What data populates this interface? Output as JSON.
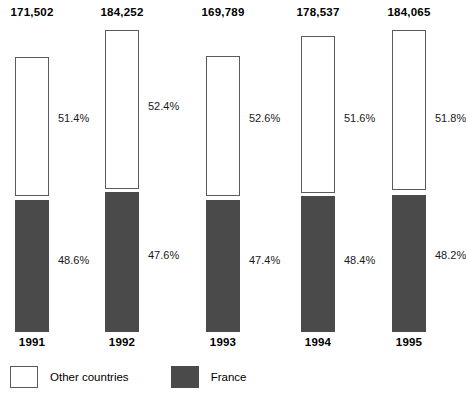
{
  "chart_data": {
    "type": "bar",
    "title": "",
    "subtitle": "",
    "xlabel": "",
    "ylabel": "",
    "stacked": true,
    "stacked_normalized": true,
    "orientation": "vertical",
    "grid": false,
    "axis_lines": false,
    "legend_position": "bottom-left",
    "categories": [
      "1991",
      "1992",
      "1993",
      "1994",
      "1995"
    ],
    "totals": [
      171502,
      184252,
      169789,
      178537,
      184065
    ],
    "total_labels": [
      "171,502",
      "184,252",
      "169,789",
      "178,537",
      "184,065"
    ],
    "series": [
      {
        "name": "Other countries",
        "color": "#ffffff",
        "border_color": "#5a5a5a",
        "values": [
          51.4,
          52.4,
          52.6,
          51.6,
          51.8
        ],
        "value_labels": [
          "51.4%",
          "52.4%",
          "52.6%",
          "51.6%",
          "51.8%"
        ]
      },
      {
        "name": "France",
        "color": "#4a4a4a",
        "border_color": "#4a4a4a",
        "values": [
          48.6,
          47.6,
          47.4,
          48.4,
          48.2
        ],
        "value_labels": [
          "48.6%",
          "47.6%",
          "47.4%",
          "48.4%",
          "48.2%"
        ]
      }
    ]
  },
  "columns": [
    {
      "year": "1991",
      "total_label": "171,502",
      "left": 15,
      "width": 34,
      "other": {
        "label": "51.4%",
        "top": 57,
        "height": 139,
        "label_top": 112
      },
      "france": {
        "label": "48.6%",
        "top": 200,
        "height": 132,
        "label_top": 254
      }
    },
    {
      "year": "1992",
      "total_label": "184,252",
      "left": 105,
      "width": 34,
      "other": {
        "label": "52.4%",
        "top": 30,
        "height": 159,
        "label_top": 100
      },
      "france": {
        "label": "47.6%",
        "top": 192,
        "height": 140,
        "label_top": 249
      }
    },
    {
      "year": "1993",
      "total_label": "169,789",
      "left": 206,
      "width": 34,
      "other": {
        "label": "52.6%",
        "top": 56,
        "height": 140,
        "label_top": 112
      },
      "france": {
        "label": "47.4%",
        "top": 200,
        "height": 132,
        "label_top": 254
      }
    },
    {
      "year": "1994",
      "total_label": "178,537",
      "left": 301,
      "width": 34,
      "other": {
        "label": "51.6%",
        "top": 36,
        "height": 157,
        "label_top": 112
      },
      "france": {
        "label": "48.4%",
        "top": 196,
        "height": 136,
        "label_top": 254
      }
    },
    {
      "year": "1995",
      "total_label": "184,065",
      "left": 392,
      "width": 34,
      "other": {
        "label": "51.8%",
        "top": 30,
        "height": 160,
        "label_top": 112
      },
      "france": {
        "label": "48.2%",
        "top": 195,
        "height": 137,
        "label_top": 249
      }
    }
  ],
  "legend": {
    "entries": [
      {
        "label": "Other countries",
        "swatch": "swatch-other",
        "swatch_name": "legend-swatch-other-countries"
      },
      {
        "label": "France",
        "swatch": "swatch-france",
        "swatch_name": "legend-swatch-france"
      }
    ]
  }
}
